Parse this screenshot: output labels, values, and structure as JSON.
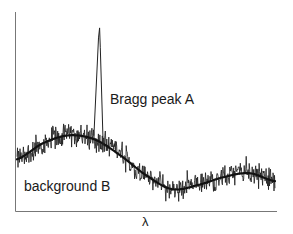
{
  "chart_data": {
    "type": "line",
    "title": "",
    "xlabel": "λ",
    "ylabel": "",
    "grid": false,
    "legend": null,
    "x_ticks": [],
    "y_ticks": [],
    "xlim": [
      0,
      1
    ],
    "ylim": [
      0,
      1
    ],
    "annotations": [
      {
        "text": "Bragg peak A",
        "x": 0.42,
        "y": 0.56
      },
      {
        "text": "background B",
        "x": 0.04,
        "y": 0.12
      }
    ],
    "series": [
      {
        "name": "background B (smooth fit)",
        "style": "thick smooth curve",
        "x": [
          0.0,
          0.1,
          0.2,
          0.3,
          0.4,
          0.5,
          0.6,
          0.7,
          0.8,
          0.9,
          1.0
        ],
        "y": [
          0.26,
          0.34,
          0.38,
          0.36,
          0.28,
          0.18,
          0.11,
          0.13,
          0.17,
          0.19,
          0.15
        ]
      },
      {
        "name": "measured signal (noisy)",
        "style": "thin noisy line around background",
        "noise_amplitude": 0.05
      },
      {
        "name": "Bragg peak A",
        "style": "sharp narrow peak",
        "peak_x": 0.32,
        "peak_y": 0.92,
        "width": 0.012
      }
    ]
  },
  "labels": {
    "peak": "Bragg peak A",
    "background": "background B",
    "x_axis": "λ"
  },
  "colors": {
    "line": "#1a1a1a",
    "axis": "#555555",
    "background": "#ffffff"
  }
}
